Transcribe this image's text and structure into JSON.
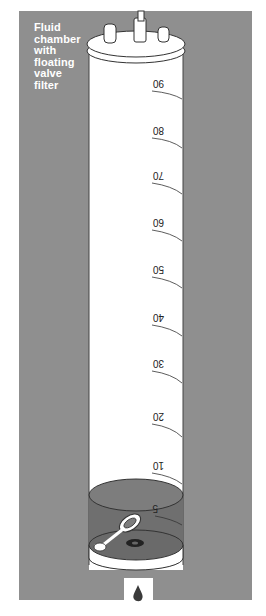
{
  "caption": {
    "lines": [
      "Fluid",
      "chamber",
      "with",
      "floating",
      "valve",
      "filter"
    ]
  },
  "scale": {
    "marks": [
      {
        "label": "90",
        "y": 88
      },
      {
        "label": "80",
        "y": 135
      },
      {
        "label": "70",
        "y": 180
      },
      {
        "label": "60",
        "y": 227
      },
      {
        "label": "50",
        "y": 274
      },
      {
        "label": "40",
        "y": 322
      },
      {
        "label": "30",
        "y": 368
      },
      {
        "label": "20",
        "y": 421
      },
      {
        "label": "10",
        "y": 470
      },
      {
        "label": "5",
        "y": 513
      }
    ]
  },
  "colors": {
    "background_panel": "#8f8f8f",
    "chamber": "#ffffff",
    "fluid": "#6f6f6f",
    "drop": "#3a3a3a"
  }
}
